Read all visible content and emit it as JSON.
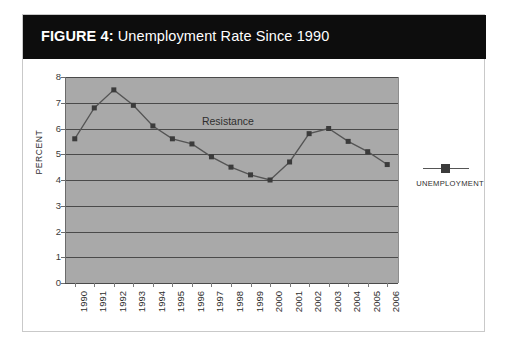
{
  "figure": {
    "title_prefix": "FIGURE 4:",
    "title_rest": " Unemployment Rate Since 1990"
  },
  "legend": {
    "entry_label": "UNEMPLOYMENT",
    "marker_icon": "filled-square-marker"
  },
  "axes": {
    "y_title": "PERCENT",
    "y_ticks": [
      "8",
      "7",
      "6",
      "5",
      "4",
      "3",
      "2",
      "1",
      "0"
    ],
    "x_ticks": [
      "1990",
      "1991",
      "1992",
      "1993",
      "1994",
      "1995",
      "1996",
      "1997",
      "1998",
      "1999",
      "2000",
      "2001",
      "2002",
      "2003",
      "2004",
      "2005",
      "2006"
    ]
  },
  "annotations": [
    {
      "text": "Resistance",
      "x_year": "1996",
      "y_value": 6.25
    }
  ],
  "colors": {
    "title_bar": "#0d0d0d",
    "title_text": "#ffffff",
    "plot_background": "#a9a9a9",
    "gridline": "#4a4a4a",
    "series_line": "#555555",
    "series_marker": "#3b3b3b",
    "frame_border": "#c9c9c9"
  },
  "chart_data": {
    "type": "line",
    "title": "FIGURE 4: Unemployment Rate Since 1990",
    "xlabel": "",
    "ylabel": "PERCENT",
    "ylim": [
      0,
      8
    ],
    "ytick_step": 1,
    "grid": true,
    "legend_position": "right",
    "categories": [
      "1990",
      "1991",
      "1992",
      "1993",
      "1994",
      "1995",
      "1996",
      "1997",
      "1998",
      "1999",
      "2000",
      "2001",
      "2002",
      "2003",
      "2004",
      "2005",
      "2006"
    ],
    "series": [
      {
        "name": "UNEMPLOYMENT",
        "values": [
          5.6,
          6.8,
          7.5,
          6.9,
          6.1,
          5.6,
          5.4,
          4.9,
          4.5,
          4.2,
          4.0,
          4.7,
          5.8,
          6.0,
          5.5,
          5.1,
          4.6
        ]
      }
    ],
    "annotations": [
      {
        "text": "Resistance",
        "x": "1996",
        "y": 6.25
      }
    ]
  }
}
